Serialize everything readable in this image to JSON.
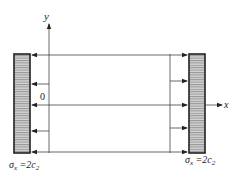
{
  "diagram": {
    "axes": {
      "x_label": "x",
      "y_label": "y",
      "origin_label": "0"
    },
    "left_support": {
      "label_sigma": "σ",
      "label_sub": "x",
      "label_eq": " =2c",
      "label_sub2": "2"
    },
    "right_support": {
      "label_sigma": "σ",
      "label_sub": "x",
      "label_eq": " =2c",
      "label_sub2": "2"
    },
    "colors": {
      "line": "#333333",
      "hatch_fill": "#cfcfcf",
      "hatch_line": "#555555",
      "border": "#222222"
    }
  }
}
